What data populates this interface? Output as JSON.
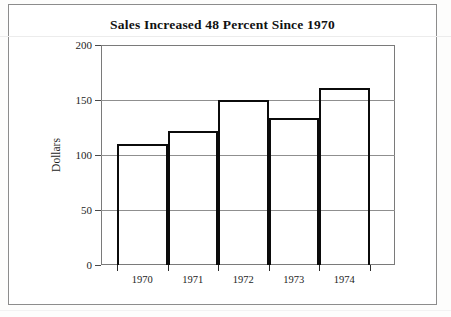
{
  "figure": {
    "title": "Sales Increased 48 Percent Since 1970",
    "axis_title_y": "Dollars"
  },
  "chart_data": {
    "type": "bar",
    "title": "Sales Increased 48 Percent Since 1970",
    "xlabel": "",
    "ylabel": "Dollars",
    "categories": [
      "1970",
      "1971",
      "1972",
      "1973",
      "1974"
    ],
    "values": [
      110,
      122,
      150,
      134,
      161
    ],
    "ylim": [
      0,
      200
    ],
    "yticks": [
      0,
      50,
      100,
      150,
      200
    ],
    "ytick_labels": [
      "0",
      "50",
      "100",
      "150",
      "200"
    ],
    "grid": true,
    "legend": null,
    "bar_style": {
      "fill": "none",
      "edge_color": "#0b0b0b",
      "edge_width": 2.5
    },
    "colors": {
      "background": "#ffffff",
      "axis": "#7a7a7a",
      "grid": "#8f8f8f",
      "text": "#1d1d1d"
    }
  }
}
